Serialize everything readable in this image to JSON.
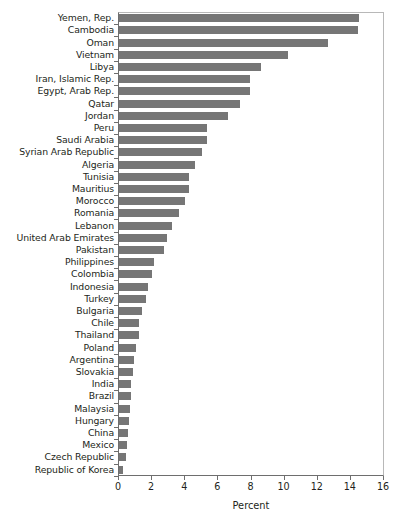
{
  "chart_data": {
    "type": "bar",
    "orientation": "horizontal",
    "title": "",
    "subtitle": "",
    "xlabel": "Percent",
    "ylabel": "",
    "xlim": [
      0,
      16
    ],
    "xticks": [
      0,
      2,
      4,
      6,
      8,
      10,
      12,
      14,
      16
    ],
    "xtick_labels": [
      "0",
      "2",
      "4",
      "6",
      "8",
      "10",
      "12",
      "14",
      "16"
    ],
    "grid": false,
    "legend": null,
    "bar_color": "#767676",
    "axis_color": "#6e6e6e",
    "categories": [
      "Yemen, Rep.",
      "Cambodia",
      "Oman",
      "Vietnam",
      "Libya",
      "Iran, Islamic Rep.",
      "Egypt, Arab Rep.",
      "Qatar",
      "Jordan",
      "Peru",
      "Saudi Arabia",
      "Syrian Arab Republic",
      "Algeria",
      "Tunisia",
      "Mauritius",
      "Morocco",
      "Romania",
      "Lebanon",
      "United Arab Emirates",
      "Pakistan",
      "Philippines",
      "Colombia",
      "Indonesia",
      "Turkey",
      "Bulgaria",
      "Chile",
      "Thailand",
      "Poland",
      "Argentina",
      "Slovakia",
      "India",
      "Brazil",
      "Malaysia",
      "Hungary",
      "China",
      "Mexico",
      "Czech Republic",
      "Republic of Korea"
    ],
    "values": [
      14.5,
      14.4,
      12.6,
      10.2,
      8.6,
      7.9,
      7.9,
      7.3,
      6.6,
      5.3,
      5.3,
      5.0,
      4.6,
      4.2,
      4.2,
      4.0,
      3.6,
      3.2,
      2.9,
      2.7,
      2.1,
      2.0,
      1.75,
      1.6,
      1.4,
      1.2,
      1.2,
      1.0,
      0.9,
      0.85,
      0.75,
      0.7,
      0.65,
      0.6,
      0.55,
      0.5,
      0.45,
      0.25
    ]
  }
}
